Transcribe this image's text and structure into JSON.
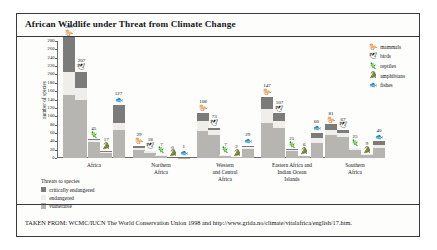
{
  "figure": {
    "title": "African Wildlife under Threat from Climate Change",
    "source": "TAKEN FROM: WCMC/IUCN The World Conservation Union 1998 and http://www.grida.no/climate/vitalafrica/english/17.htm."
  },
  "species_legend": {
    "items": [
      {
        "label": "mammals",
        "icon": "mammal-icon",
        "glyph": "🐎"
      },
      {
        "label": "birds",
        "icon": "bird-icon",
        "glyph": "🕊"
      },
      {
        "label": "reptiles",
        "icon": "reptile-icon",
        "glyph": "🦎"
      },
      {
        "label": "amphibians",
        "icon": "amphibian-icon",
        "glyph": "🐊"
      },
      {
        "label": "fishes",
        "icon": "fish-icon",
        "glyph": "🐟"
      }
    ]
  },
  "threats_legend": {
    "heading": "Threats to species",
    "items": [
      {
        "label": "critically endangered",
        "key": "crit",
        "color": "#7b7b7a"
      },
      {
        "label": "endangered",
        "key": "endg",
        "color": "#efeeea"
      },
      {
        "label": "vulnerable",
        "key": "vuln",
        "color": "#b6b5b1"
      }
    ]
  },
  "chart_data": {
    "type": "bar",
    "title": "African Wildlife under Threat from Climate Change",
    "xlabel": "",
    "ylabel": "number of species",
    "ylim": [
      0,
      280
    ],
    "ytick_step": 20,
    "yticks": [
      0,
      20,
      40,
      60,
      80,
      100,
      120,
      140,
      160,
      180,
      200,
      220,
      240,
      260,
      280
    ],
    "grid": false,
    "legend_position": "top-right",
    "stacked": true,
    "stack_order_bottom_to_top": [
      "vulnerable",
      "endangered",
      "critically endangered"
    ],
    "categories": [
      "Africa",
      "Northern Africa",
      "Western and Central Africa",
      "Eastern Africa and Indian Ocean Islands",
      "Southern Africa"
    ],
    "groups": [
      {
        "label": "Africa",
        "label_lines": [
          "Africa"
        ],
        "bars": [
          {
            "species": "mammals",
            "total": 289,
            "vulnerable": 150,
            "endangered": 55,
            "critically_endangered": 84
          },
          {
            "species": "birds",
            "total": 207,
            "vulnerable": 139,
            "endangered": 28,
            "critically_endangered": 40
          },
          {
            "species": "reptiles",
            "total": 45,
            "vulnerable": 38,
            "endangered": 4,
            "critically_endangered": 3
          },
          {
            "species": "amphibians",
            "total": 17,
            "vulnerable": 13,
            "endangered": 2,
            "critically_endangered": 2
          },
          {
            "species": "fishes",
            "total": 127,
            "vulnerable": 66,
            "endangered": 18,
            "critically_endangered": 43
          }
        ]
      },
      {
        "label": "Northern Africa",
        "label_lines": [
          "Northern",
          "Africa"
        ],
        "bars": [
          {
            "species": "mammals",
            "total": 29,
            "vulnerable": 18,
            "endangered": 5,
            "critically_endangered": 6
          },
          {
            "species": "birds",
            "total": 18,
            "vulnerable": 13,
            "endangered": 3,
            "critically_endangered": 2
          },
          {
            "species": "reptiles",
            "total": 7,
            "vulnerable": 6,
            "endangered": 1,
            "critically_endangered": 0
          },
          {
            "species": "amphibians",
            "total": 0,
            "vulnerable": 0,
            "endangered": 0,
            "critically_endangered": 0
          },
          {
            "species": "fishes",
            "total": 1,
            "vulnerable": 1,
            "endangered": 0,
            "critically_endangered": 0
          }
        ]
      },
      {
        "label": "Western and Central Africa",
        "label_lines": [
          "Western",
          "and Central",
          "Africa"
        ],
        "bars": [
          {
            "species": "mammals",
            "total": 108,
            "vulnerable": 64,
            "endangered": 25,
            "critically_endangered": 19
          },
          {
            "species": "birds",
            "total": 73,
            "vulnerable": 56,
            "endangered": 10,
            "critically_endangered": 7
          },
          {
            "species": "reptiles",
            "total": 7,
            "vulnerable": 6,
            "endangered": 1,
            "critically_endangered": 0
          },
          {
            "species": "amphibians",
            "total": 2,
            "vulnerable": 2,
            "endangered": 0,
            "critically_endangered": 0
          },
          {
            "species": "fishes",
            "total": 29,
            "vulnerable": 22,
            "endangered": 4,
            "critically_endangered": 3
          }
        ]
      },
      {
        "label": "Eastern Africa and Indian Ocean Islands",
        "label_lines": [
          "Eastern Africa and",
          "Indian Ocean",
          "Islands"
        ],
        "bars": [
          {
            "species": "mammals",
            "total": 147,
            "vulnerable": 84,
            "endangered": 34,
            "critically_endangered": 29
          },
          {
            "species": "birds",
            "total": 107,
            "vulnerable": 72,
            "endangered": 17,
            "critically_endangered": 18
          },
          {
            "species": "reptiles",
            "total": 21,
            "vulnerable": 16,
            "endangered": 3,
            "critically_endangered": 2
          },
          {
            "species": "amphibians",
            "total": 6,
            "vulnerable": 5,
            "endangered": 1,
            "critically_endangered": 0
          },
          {
            "species": "fishes",
            "total": 60,
            "vulnerable": 37,
            "endangered": 10,
            "critically_endangered": 13
          }
        ]
      },
      {
        "label": "Southern Africa",
        "label_lines": [
          "Southern",
          "Africa"
        ],
        "bars": [
          {
            "species": "mammals",
            "total": 81,
            "vulnerable": 54,
            "endangered": 14,
            "critically_endangered": 13
          },
          {
            "species": "birds",
            "total": 67,
            "vulnerable": 50,
            "endangered": 9,
            "critically_endangered": 8
          },
          {
            "species": "reptiles",
            "total": 25,
            "vulnerable": 20,
            "endangered": 3,
            "critically_endangered": 2
          },
          {
            "species": "amphibians",
            "total": 9,
            "vulnerable": 8,
            "endangered": 1,
            "critically_endangered": 0
          },
          {
            "species": "fishes",
            "total": 40,
            "vulnerable": 25,
            "endangered": 7,
            "critically_endangered": 8
          }
        ]
      }
    ]
  }
}
